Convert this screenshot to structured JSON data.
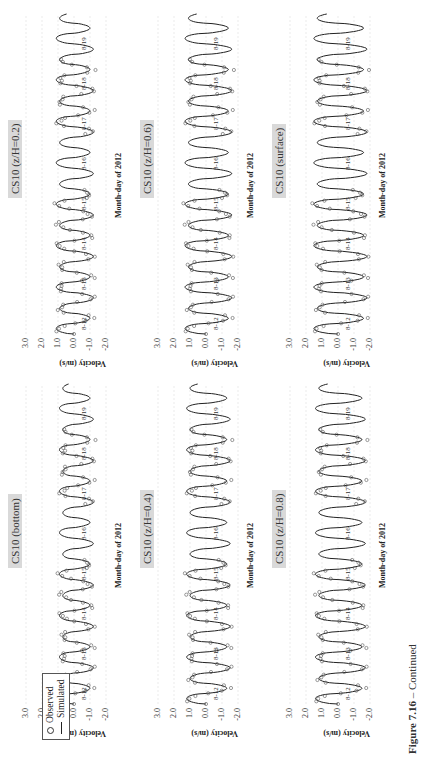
{
  "figure": {
    "caption_label": "Figure 7.16",
    "caption_text": " – Continued",
    "legend": {
      "observed": "Observed",
      "simulated": "Simulated"
    }
  },
  "chart_data": [
    {
      "type": "line",
      "title": "CS10 (bottom)",
      "xlabel": "Month-day of 2012",
      "ylabel": "Velocity (m/s)",
      "ylim": [
        -2.0,
        3.0
      ],
      "yticks": [
        "3.0",
        "2.0",
        "1.0",
        "0.0",
        "-1.0",
        "-2.0"
      ],
      "xticks": [
        "8-12",
        "8-13",
        "8-14",
        "8-15",
        "8-16",
        "8-17",
        "8-18",
        "8-19"
      ],
      "grid": true,
      "amp_pos": 0.8,
      "amp_neg": -1.1,
      "series": [
        {
          "name": "Simulated",
          "style": "line"
        },
        {
          "name": "Observed",
          "style": "circles",
          "coverage": "8-12 to 8-15, 8-17 to 8-18"
        }
      ]
    },
    {
      "type": "line",
      "title": "CS10 (z/H=0.2)",
      "xlabel": "Month-day of 2012",
      "ylabel": "Velocity (m/s)",
      "ylim": [
        -2.0,
        3.0
      ],
      "yticks": [
        "3.0",
        "2.0",
        "1.0",
        "0.0",
        "-1.0",
        "-2.0"
      ],
      "xticks": [
        "8-12",
        "8-13",
        "8-14",
        "8-15",
        "8-16",
        "8-17",
        "8-18",
        "8-19"
      ],
      "grid": true,
      "amp_pos": 1.0,
      "amp_neg": -1.1,
      "series": [
        {
          "name": "Simulated",
          "style": "line"
        },
        {
          "name": "Observed",
          "style": "circles",
          "coverage": "8-12 to 8-15, 8-17 to 8-18"
        }
      ]
    },
    {
      "type": "line",
      "title": "CS10 (z/H=0.4)",
      "xlabel": "Month-day of 2012",
      "ylabel": "Velocity (m/s)",
      "ylim": [
        -2.0,
        3.0
      ],
      "yticks": [
        "3.0",
        "2.0",
        "1.0",
        "0.0",
        "-1.0",
        "-2.0"
      ],
      "xticks": [
        "8-12",
        "8-13",
        "8-14",
        "8-15",
        "8-16",
        "8-17",
        "8-18",
        "8-19"
      ],
      "grid": true,
      "amp_pos": 1.1,
      "amp_neg": -1.4,
      "series": [
        {
          "name": "Simulated",
          "style": "line"
        },
        {
          "name": "Observed",
          "style": "circles",
          "coverage": "8-12 to 8-15, 8-17 to 8-18"
        }
      ]
    },
    {
      "type": "line",
      "title": "CS10 (z/H=0.6)",
      "xlabel": "Month-day of 2012",
      "ylabel": "Velocity (m/s)",
      "ylim": [
        -2.0,
        3.0
      ],
      "yticks": [
        "3.0",
        "2.0",
        "1.0",
        "0.0",
        "-1.0",
        "-2.0"
      ],
      "xticks": [
        "8-12",
        "8-13",
        "8-14",
        "8-15",
        "8-16",
        "8-17",
        "8-18",
        "8-19"
      ],
      "grid": true,
      "amp_pos": 1.2,
      "amp_neg": -1.5,
      "series": [
        {
          "name": "Simulated",
          "style": "line"
        },
        {
          "name": "Observed",
          "style": "circles",
          "coverage": "8-12 to 8-15, 8-17 to 8-18"
        }
      ]
    },
    {
      "type": "line",
      "title": "CS10 (z/H=0.8)",
      "xlabel": "Month-day of 2012",
      "ylabel": "Velocity (m/s)",
      "ylim": [
        -2.0,
        3.0
      ],
      "yticks": [
        "3.0",
        "2.0",
        "1.0",
        "0.0",
        "-1.0",
        "-2.0"
      ],
      "xticks": [
        "8-12",
        "8-13",
        "8-14",
        "8-15",
        "8-16",
        "8-17",
        "8-18",
        "8-19"
      ],
      "grid": true,
      "amp_pos": 1.3,
      "amp_neg": -1.6,
      "series": [
        {
          "name": "Simulated",
          "style": "line"
        },
        {
          "name": "Observed",
          "style": "circles",
          "coverage": "8-12 to 8-15, 8-17 to 8-18"
        }
      ]
    },
    {
      "type": "line",
      "title": "CS10 (surface)",
      "xlabel": "Month-day of 2012",
      "ylabel": "Velocity (m/s)",
      "ylim": [
        -2.0,
        3.0
      ],
      "yticks": [
        "3.0",
        "2.0",
        "1.0",
        "0.0",
        "-1.0",
        "-2.0"
      ],
      "xticks": [
        "8-12",
        "8-13",
        "8-14",
        "8-15",
        "8-16",
        "8-17",
        "8-18",
        "8-19"
      ],
      "grid": true,
      "amp_pos": 1.4,
      "amp_neg": -1.7,
      "series": [
        {
          "name": "Simulated",
          "style": "line"
        },
        {
          "name": "Observed",
          "style": "circles",
          "coverage": "8-12 to 8-15, 8-17 to 8-18"
        }
      ]
    }
  ]
}
